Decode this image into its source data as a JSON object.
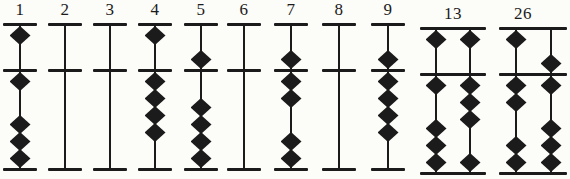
{
  "figure": {
    "ink_color": "#1b1b1b",
    "paper_color": "#fcfcf9",
    "earth_beads_per_rod": 4,
    "heaven_beads_per_rod": 1
  },
  "geometry": {
    "top_y": 23,
    "beam_y": 69,
    "bottom_y": 168,
    "bar_thickness": 3,
    "rod_width": 2,
    "bead_w": 21,
    "bead_h": 19,
    "pitch": 17,
    "label_top": 0
  },
  "columns": [
    {
      "label": "1",
      "value": 1,
      "center_x": 20,
      "dy": 0,
      "bar_span": [
        3,
        37
      ],
      "rods": [
        {
          "x": 20,
          "blank": false,
          "heaven": "up",
          "earth_up": 1
        }
      ]
    },
    {
      "label": "2",
      "value": 2,
      "center_x": 65,
      "dy": 0,
      "bar_span": [
        48,
        82
      ],
      "rods": [
        {
          "x": 65,
          "blank": true
        }
      ]
    },
    {
      "label": "3",
      "value": 3,
      "center_x": 110,
      "dy": 0,
      "bar_span": [
        93,
        127
      ],
      "rods": [
        {
          "x": 110,
          "blank": true
        }
      ]
    },
    {
      "label": "4",
      "value": 4,
      "center_x": 155,
      "dy": 0,
      "bar_span": [
        138,
        172
      ],
      "rods": [
        {
          "x": 155,
          "blank": false,
          "heaven": "up",
          "earth_up": 4
        }
      ]
    },
    {
      "label": "5",
      "value": 5,
      "center_x": 201,
      "dy": 0,
      "bar_span": [
        184,
        218
      ],
      "rods": [
        {
          "x": 201,
          "blank": false,
          "heaven": "down",
          "earth_up": 0
        }
      ]
    },
    {
      "label": "6",
      "value": 6,
      "center_x": 244,
      "dy": 0,
      "bar_span": [
        227,
        261
      ],
      "rods": [
        {
          "x": 244,
          "blank": true
        }
      ]
    },
    {
      "label": "7",
      "value": 7,
      "center_x": 291,
      "dy": 0,
      "bar_span": [
        274,
        308
      ],
      "rods": [
        {
          "x": 291,
          "blank": false,
          "heaven": "down",
          "earth_up": 2
        }
      ]
    },
    {
      "label": "8",
      "value": 8,
      "center_x": 339,
      "dy": 0,
      "bar_span": [
        322,
        356
      ],
      "rods": [
        {
          "x": 339,
          "blank": true
        }
      ]
    },
    {
      "label": "9",
      "value": 9,
      "center_x": 388,
      "dy": 0,
      "bar_span": [
        371,
        405
      ],
      "rods": [
        {
          "x": 388,
          "blank": false,
          "heaven": "down",
          "earth_up": 4
        }
      ]
    },
    {
      "label": "13",
      "value": 13,
      "center_x": 453,
      "dy": 4,
      "bar_span": [
        420,
        486
      ],
      "rods": [
        {
          "x": 436,
          "blank": false,
          "heaven": "up",
          "earth_up": 1
        },
        {
          "x": 470,
          "blank": false,
          "heaven": "up",
          "earth_up": 3
        }
      ]
    },
    {
      "label": "26",
      "value": 26,
      "center_x": 523,
      "dy": 4,
      "bar_span": [
        499,
        567
      ],
      "rods": [
        {
          "x": 516,
          "blank": false,
          "heaven": "up",
          "earth_up": 2
        },
        {
          "x": 551,
          "blank": false,
          "heaven": "down",
          "earth_up": 1
        }
      ]
    }
  ]
}
